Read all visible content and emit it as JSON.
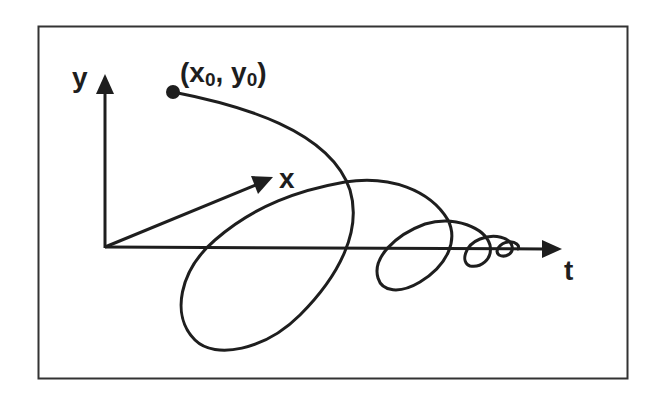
{
  "diagram": {
    "axes": {
      "y": {
        "label": "y"
      },
      "x": {
        "label": "x"
      },
      "t": {
        "label": "t"
      }
    },
    "start_point": {
      "label_open": "(x",
      "sub_x": "0",
      "label_mid": ", y",
      "sub_y": "0",
      "label_close": ")",
      "full_label": "(x0, y0)"
    },
    "colors": {
      "ink": "#1e1e1e",
      "frame": "#333333",
      "background": "#ffffff"
    }
  }
}
